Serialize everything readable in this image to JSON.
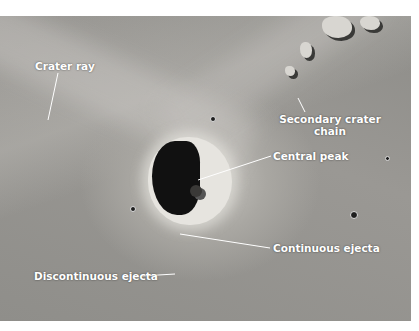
{
  "figure": {
    "labels": {
      "crater_ray": "Crater ray",
      "secondary_crater_chain_line1": "Secondary crater",
      "secondary_crater_chain_line2": "chain",
      "central_peak": "Central peak",
      "continuous_ejecta": "Continuous ejecta",
      "discontinuous_ejecta": "Discontinuous ejecta"
    },
    "colors": {
      "label_text": "#ffffff",
      "leader_line": "#ffffff",
      "surface": "#95938f",
      "crater_shadow": "#111111"
    }
  }
}
